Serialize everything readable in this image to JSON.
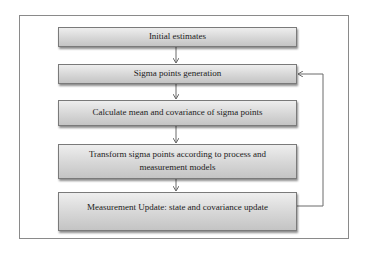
{
  "diagram": {
    "steps": [
      {
        "id": "initial",
        "label": "Initial estimates"
      },
      {
        "id": "sigma-gen",
        "label": "Sigma points generation"
      },
      {
        "id": "mean-cov",
        "label": "Calculate mean and covariance of sigma points"
      },
      {
        "id": "transform",
        "label": "Transform sigma points according to process and measurement models"
      },
      {
        "id": "meas-update",
        "label": "Measurement Update: state and covariance update"
      }
    ],
    "edges": [
      {
        "from": "initial",
        "to": "sigma-gen"
      },
      {
        "from": "sigma-gen",
        "to": "mean-cov"
      },
      {
        "from": "mean-cov",
        "to": "transform"
      },
      {
        "from": "transform",
        "to": "meas-update"
      },
      {
        "from": "meas-update",
        "to": "sigma-gen",
        "type": "feedback-loop"
      }
    ],
    "colors": {
      "box_fill": "#d6d6d6",
      "border": "#7a7a7a",
      "line": "#6a6a6a"
    }
  }
}
